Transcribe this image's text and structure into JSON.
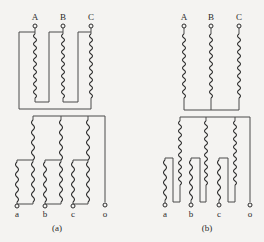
{
  "diagrams": [
    {
      "caption": "(a)",
      "primary_terminals": [
        "A",
        "B",
        "C"
      ],
      "secondary_terminals": [
        "a",
        "b",
        "c",
        "o"
      ],
      "primary_connection": "delta",
      "secondary_connection": "zigzag"
    },
    {
      "caption": "(b)",
      "primary_terminals": [
        "A",
        "B",
        "C"
      ],
      "secondary_terminals": [
        "a",
        "b",
        "c",
        "o"
      ],
      "primary_connection": "star",
      "secondary_connection": "zigzag"
    }
  ],
  "colors": {
    "background": "#f4f3f1",
    "line": "#2c2c2c"
  }
}
